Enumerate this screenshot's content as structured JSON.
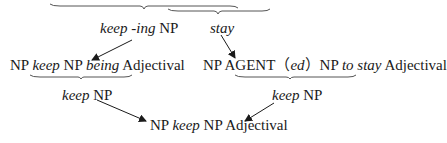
{
  "nodes": {
    "top_left": {
      "italic": "keep -ing",
      "plain": " NP"
    },
    "top_right": {
      "italic": "stay"
    },
    "mid_left": {
      "p1": "NP ",
      "i1": "keep",
      "p2": " NP ",
      "i2": "being",
      "p3": " Adjectival"
    },
    "mid_right": {
      "p1": "NP AGENT（",
      "i1": "ed",
      "p2": "）NP ",
      "i2": "to stay",
      "p3": " Adjectival"
    },
    "low_left": {
      "italic": "keep",
      "plain": " NP"
    },
    "low_right": {
      "italic": "keep",
      "plain": " NP"
    },
    "bottom": {
      "p1": "NP ",
      "i1": "keep",
      "p2": " NP Adjectival"
    }
  },
  "colors": {
    "ink": "#1a1a1a",
    "line": "#555555"
  }
}
